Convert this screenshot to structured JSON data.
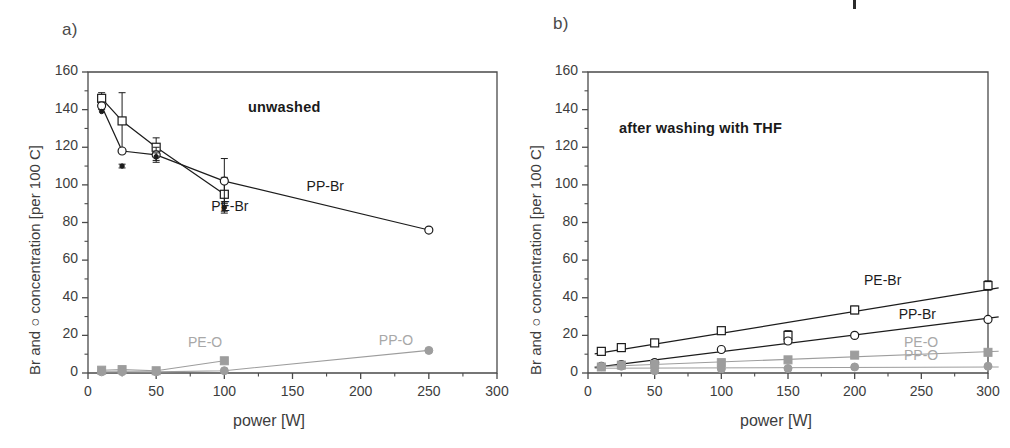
{
  "figure": {
    "width": 1010,
    "height": 448,
    "background": "#ffffff",
    "axis_color": "#4a4a4a",
    "br_color": "#1c1c1c",
    "oxygen_color": "#9d9d9d"
  },
  "panels": [
    {
      "id": "a",
      "label": "a)",
      "title": "unwashed",
      "xlabel": "power [W]",
      "ylabel": "Br and ○ concentration [per 100 C]",
      "xticks": [
        0,
        50,
        100,
        150,
        200,
        250,
        300
      ],
      "yticks": [
        0,
        20,
        40,
        60,
        80,
        100,
        120,
        140,
        160
      ],
      "xlim": [
        0,
        300
      ],
      "ylim": [
        0,
        160
      ],
      "xminor_step": 25,
      "yminor_step": 10,
      "series_labels": [
        {
          "name": "PE-Br",
          "x": 105,
          "y": 88,
          "color": "#1c1c1c"
        },
        {
          "name": "PP-Br",
          "x": 175,
          "y": 99,
          "color": "#1c1c1c"
        },
        {
          "name": "PE-O",
          "x": 88,
          "y": 16,
          "color": "#9d9d9d"
        },
        {
          "name": "PP-O",
          "x": 228,
          "y": 17,
          "color": "#9d9d9d"
        }
      ]
    },
    {
      "id": "b",
      "label": "b)",
      "title": "after washing with THF",
      "xlabel": "power [W]",
      "ylabel": "Br and ○ concentration [per 100 C]",
      "xticks": [
        0,
        50,
        100,
        150,
        200,
        250,
        300
      ],
      "yticks": [
        0,
        20,
        40,
        60,
        80,
        100,
        120,
        140,
        160
      ],
      "xlim": [
        0,
        300
      ],
      "ylim": [
        0,
        160
      ],
      "xminor_step": 25,
      "yminor_step": 10,
      "series_labels": [
        {
          "name": "PE-Br",
          "x": 222,
          "y": 49,
          "color": "#1c1c1c"
        },
        {
          "name": "PP-Br",
          "x": 248,
          "y": 31,
          "color": "#1c1c1c"
        },
        {
          "name": "PE-O",
          "x": 252,
          "y": 16,
          "color": "#9d9d9d"
        },
        {
          "name": "PP-O",
          "x": 252,
          "y": 9,
          "color": "#9d9d9d"
        }
      ]
    }
  ],
  "chart_data": [
    {
      "type": "line",
      "panel": "a",
      "title": "unwashed",
      "xlabel": "power [W]",
      "ylabel": "Br and ○ concentration [per 100 C]",
      "xlim": [
        0,
        300
      ],
      "ylim": [
        0,
        160
      ],
      "grid": false,
      "legend": "inline-annotations",
      "series": [
        {
          "name": "PE-Br",
          "marker": "open-square",
          "color": "#1c1c1c",
          "x": [
            10,
            25,
            50,
            100
          ],
          "values": [
            146,
            134,
            120,
            95
          ],
          "yerr": [
            3,
            15,
            5,
            9
          ]
        },
        {
          "name": "PP-Br",
          "marker": "open-circle",
          "color": "#1c1c1c",
          "x": [
            10,
            25,
            50,
            100,
            250
          ],
          "values": [
            142,
            118,
            116,
            102,
            76
          ],
          "yerr": [
            2,
            0,
            4,
            12,
            1
          ]
        },
        {
          "name": "PE-Br-extra",
          "marker": "filled-small",
          "color": "#1c1c1c",
          "x": [
            10,
            25,
            50,
            100
          ],
          "values": [
            139,
            110,
            115,
            88
          ],
          "yerr": [
            0,
            1,
            2,
            3
          ]
        },
        {
          "name": "PE-O",
          "marker": "filled-square",
          "color": "#9d9d9d",
          "x": [
            10,
            25,
            50,
            100
          ],
          "values": [
            1.5,
            1.8,
            1.2,
            6.5
          ],
          "yerr": [
            0,
            0,
            0,
            0
          ]
        },
        {
          "name": "PP-O",
          "marker": "filled-circle",
          "color": "#9d9d9d",
          "x": [
            10,
            25,
            50,
            100,
            250
          ],
          "values": [
            0.6,
            0.7,
            0.6,
            1.2,
            12
          ],
          "yerr": [
            0,
            0,
            0,
            0,
            0
          ]
        }
      ]
    },
    {
      "type": "line",
      "panel": "b",
      "title": "after washing with THF",
      "xlabel": "power [W]",
      "ylabel": "Br and ○ concentration [per 100 C]",
      "xlim": [
        0,
        300
      ],
      "ylim": [
        0,
        160
      ],
      "grid": false,
      "legend": "inline-annotations",
      "series": [
        {
          "name": "PE-Br",
          "marker": "open-square",
          "color": "#1c1c1c",
          "x": [
            10,
            25,
            50,
            100,
            150,
            200,
            300
          ],
          "values": [
            11.5,
            13.5,
            16,
            22.5,
            20,
            33.5,
            46.5
          ],
          "yerr": [
            0.8,
            0.8,
            0.8,
            0.8,
            2.5,
            2,
            2.5
          ]
        },
        {
          "name": "PP-Br",
          "marker": "open-circle",
          "color": "#1c1c1c",
          "x": [
            10,
            25,
            50,
            100,
            150,
            200,
            300
          ],
          "values": [
            3.5,
            4.5,
            5.5,
            12.5,
            17,
            20,
            28.5
          ],
          "yerr": [
            0.5,
            0.5,
            1.5,
            0.8,
            1.5,
            0.8,
            0.8
          ]
        },
        {
          "name": "PE-O",
          "marker": "filled-square",
          "color": "#9d9d9d",
          "x": [
            10,
            25,
            50,
            100,
            150,
            200,
            300
          ],
          "values": [
            3.2,
            4.2,
            4.5,
            5.5,
            7,
            9.5,
            11
          ],
          "yerr": [
            0,
            0,
            0,
            0,
            0,
            0,
            0
          ]
        },
        {
          "name": "PP-O",
          "marker": "filled-circle",
          "color": "#9d9d9d",
          "x": [
            10,
            25,
            50,
            100,
            150,
            200,
            300
          ],
          "values": [
            3.4,
            3.6,
            1.2,
            2.2,
            2.4,
            3.2,
            3.6
          ],
          "yerr": [
            0,
            0,
            0,
            0,
            0,
            0,
            0
          ]
        }
      ]
    }
  ]
}
